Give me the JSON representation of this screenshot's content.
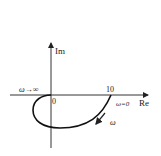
{
  "diagram": {
    "type": "nyquist-plot",
    "axes": {
      "x_label": "Re",
      "y_label": "Im",
      "origin_label": "0",
      "tick_label": "10"
    },
    "annotations": {
      "omega_infinity": "ω→∞",
      "omega_zero": "ω=0",
      "omega_direction": "ω"
    },
    "colors": {
      "line": "#222222",
      "background": "#ffffff"
    }
  }
}
